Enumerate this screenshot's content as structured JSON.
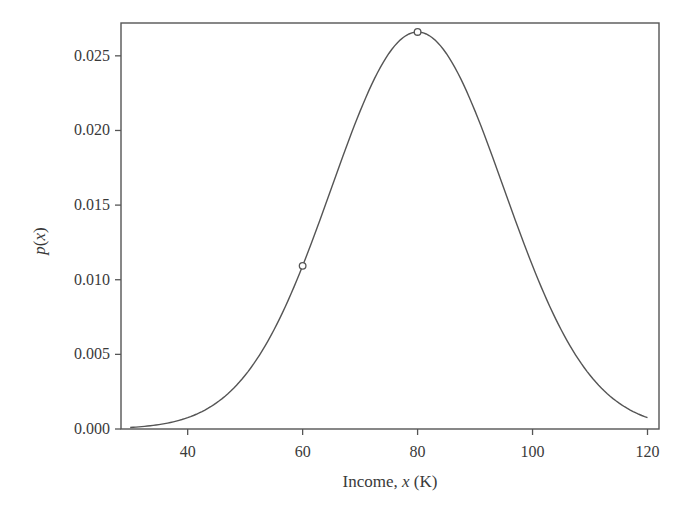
{
  "chart_data": {
    "type": "line",
    "title": "",
    "xlabel": "Income, x (K)",
    "ylabel": "p(x)",
    "xlim": [
      28.4,
      122
    ],
    "ylim": [
      0.0,
      0.0272
    ],
    "grid": false,
    "legend": null,
    "x_ticks": [
      40,
      60,
      80,
      100,
      120
    ],
    "x_tick_labels": [
      "40",
      "60",
      "80",
      "100",
      "120"
    ],
    "y_ticks": [
      0.0,
      0.005,
      0.01,
      0.015,
      0.02,
      0.025
    ],
    "y_tick_labels": [
      "0.000",
      "0.005",
      "0.010",
      "0.015",
      "0.020",
      "0.025"
    ],
    "series": [
      {
        "name": "p(x)",
        "style": "line",
        "distribution": "normal",
        "mean": 80,
        "std": 15,
        "x": [
          30,
          35,
          40,
          45,
          50,
          55,
          60,
          65,
          70,
          75,
          80,
          85,
          90,
          95,
          100,
          105,
          110,
          115,
          120
        ],
        "values": [
          0.0001,
          0.0003,
          0.00076,
          0.00173,
          0.0036,
          0.00663,
          0.01093,
          0.01613,
          0.0213,
          0.02516,
          0.0266,
          0.02516,
          0.0213,
          0.01613,
          0.01093,
          0.00663,
          0.0036,
          0.00173,
          0.00076
        ]
      },
      {
        "name": "marked points",
        "style": "scatter",
        "marker": "open-circle",
        "x": [
          60,
          80
        ],
        "values": [
          0.01093,
          0.0266
        ]
      }
    ]
  },
  "colors": {
    "line": "#555555",
    "axis": "#555555",
    "text": "#3a3a3a",
    "background": "#ffffff"
  }
}
